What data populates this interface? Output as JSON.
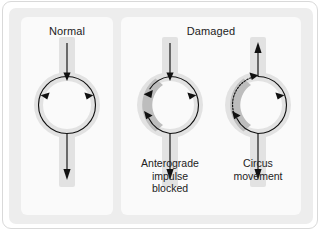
{
  "figure": {
    "name": "reentry-circus-movement-diagram",
    "panels": [
      {
        "id": "normal",
        "heading": "Normal",
        "caption": "",
        "description": "Impulse enters from above, divides and travels both ways around the ring, then exits downward."
      },
      {
        "id": "damaged",
        "heading": "Damaged",
        "caption": "",
        "sub_panels": [
          {
            "id": "blocked",
            "caption": "Anterograde\nimpulse\nblocked",
            "caption_lines": [
              "Anterograde",
              "impulse",
              "blocked"
            ],
            "description": "Impulse entering from above is blocked in the damaged segment; the opposite limb conducts and re-enters retrogradely."
          },
          {
            "id": "circus",
            "caption": "Circus\nmovement",
            "caption_lines": [
              "Circus",
              "movement"
            ],
            "description": "Retrograde impulse passes slowly through the damaged segment (dotted arc) and re-circulates, exiting both upward and downward."
          }
        ]
      }
    ]
  },
  "colors": {
    "frame_border": "#d9d9d9",
    "stage_background": "#ededed",
    "panel_background": "#fafafa",
    "tissue_track": "#e2e2e2",
    "damaged_lesion": "#bdbdbd",
    "line": "#111111",
    "text": "#222222"
  }
}
